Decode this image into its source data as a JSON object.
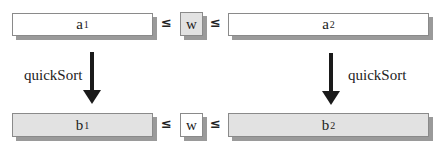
{
  "diagram": {
    "top_row": {
      "left_box": {
        "base": "a",
        "sub": "1",
        "fill": "#ffffff"
      },
      "leq_left": "≤",
      "pivot": {
        "label": "w",
        "fill": "#e2e2e2"
      },
      "leq_right": "≤",
      "right_box": {
        "base": "a",
        "sub": "2",
        "fill": "#ffffff"
      }
    },
    "arrows": {
      "left": {
        "label": "quickSort",
        "direction": "down"
      },
      "right": {
        "label": "quickSort",
        "direction": "down"
      }
    },
    "bottom_row": {
      "left_box": {
        "base": "b",
        "sub": "1",
        "fill": "#e2e2e2"
      },
      "leq_left": "≤",
      "pivot": {
        "label": "w",
        "fill": "#ffffff"
      },
      "leq_right": "≤",
      "right_box": {
        "base": "b",
        "sub": "2",
        "fill": "#e2e2e2"
      }
    }
  }
}
